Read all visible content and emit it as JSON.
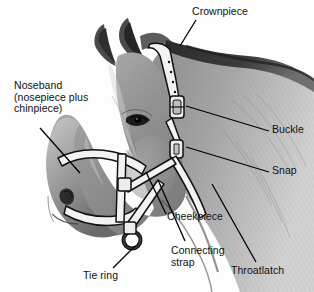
{
  "figure": {
    "type": "anatomical-illustration",
    "style": "grayscale pencil drawing",
    "background_color": "#fdfdfd",
    "line_color": "#000000",
    "text_color": "#111111"
  },
  "labels": {
    "crownpiece": "Crownpiece",
    "noseband": "Noseband\n(nosepiece plus\nchinpiece)",
    "buckle": "Buckle",
    "snap": "Snap",
    "cheekpiece": "Cheekpiece",
    "connecting_strap": "Connecting\nstrap",
    "throatlatch": "Throatlatch",
    "tie_ring": "Tie ring"
  },
  "callouts": [
    {
      "name": "crownpiece",
      "text": "Crownpiece",
      "text_x": 192,
      "text_y": 6,
      "line": [
        [
          196,
          20
        ],
        [
          180,
          44
        ]
      ]
    },
    {
      "name": "noseband",
      "text": "Noseband (nosepiece plus chinpiece)",
      "text_x": 14,
      "text_y": 80,
      "line": [
        [
          40,
          128
        ],
        [
          80,
          173
        ]
      ]
    },
    {
      "name": "buckle",
      "text": "Buckle",
      "text_x": 272,
      "text_y": 124,
      "line": [
        [
          268,
          131
        ],
        [
          186,
          106
        ]
      ]
    },
    {
      "name": "snap",
      "text": "Snap",
      "text_x": 272,
      "text_y": 165,
      "line": [
        [
          268,
          172
        ],
        [
          186,
          147
        ]
      ]
    },
    {
      "name": "cheekpiece",
      "text": "Cheekpiece",
      "text_x": 167,
      "text_y": 211,
      "line": [
        [
          166,
          215
        ],
        [
          146,
          172
        ]
      ]
    },
    {
      "name": "connecting-strap",
      "text": "Connecting strap",
      "text_x": 171,
      "text_y": 245,
      "line": [
        [
          184,
          240
        ],
        [
          158,
          180
        ]
      ]
    },
    {
      "name": "throatlatch",
      "text": "Throatlatch",
      "text_x": 231,
      "text_y": 265,
      "line": [
        [
          255,
          262
        ],
        [
          212,
          182
        ]
      ]
    },
    {
      "name": "tie-ring",
      "text": "Tie ring",
      "text_x": 83,
      "text_y": 270,
      "line": [
        [
          112,
          268
        ],
        [
          134,
          245
        ]
      ]
    }
  ]
}
